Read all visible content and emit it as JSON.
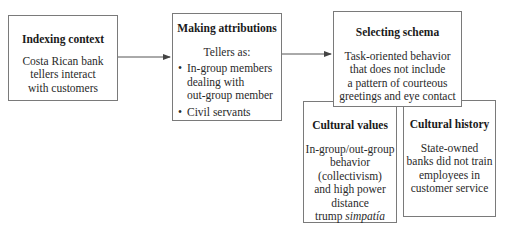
{
  "diagram": {
    "nodes": [
      {
        "id": "indexing-context",
        "title": "Indexing context",
        "lines": [
          "Costa Rican bank",
          "tellers interact",
          "with customers"
        ]
      },
      {
        "id": "making-attributions",
        "title": "Making attributions",
        "intro": "Tellers as:",
        "bullets": [
          "In-group members dealing with out-group member",
          "Civil servants"
        ],
        "bullet_lines": [
          [
            "In-group members",
            "dealing with",
            "out-group member"
          ],
          [
            "Civil servants"
          ]
        ]
      },
      {
        "id": "selecting-schema",
        "title": "Selecting schema",
        "lines": [
          "Task-oriented behavior",
          "that does not include",
          "a pattern of courteous",
          "greetings and eye contact"
        ]
      },
      {
        "id": "cultural-values",
        "title": "Cultural values",
        "lines": [
          "In-group/out-group",
          "behavior",
          "(collectivism)",
          "and high power",
          "distance"
        ],
        "last_line_prefix": "trump ",
        "last_line_italic": "simpatía"
      },
      {
        "id": "cultural-history",
        "title": "Cultural history",
        "lines": [
          "State-owned",
          "banks did not train",
          "employees in",
          "customer service"
        ]
      }
    ],
    "edges": [
      {
        "from": "indexing-context",
        "to": "making-attributions",
        "type": "arrow"
      },
      {
        "from": "making-attributions",
        "to": "selecting-schema",
        "type": "arrow"
      },
      {
        "from": "cultural-values",
        "to": "selecting-schema",
        "type": "adjacent"
      },
      {
        "from": "cultural-history",
        "to": "selecting-schema",
        "type": "adjacent"
      }
    ]
  },
  "colors": {
    "border": "#7a7a7a",
    "line": "#555555",
    "text": "#2a2a2a"
  }
}
